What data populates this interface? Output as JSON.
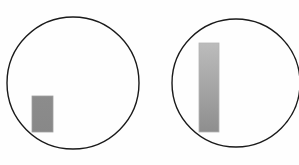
{
  "diagram": {
    "background": "#fefefe",
    "stroke_color": "#1a1a1a",
    "figures": [
      {
        "id": "left",
        "circle": {
          "cx": 73,
          "cy": 83,
          "r": 66
        },
        "bar": {
          "x": 32,
          "y": 96,
          "width": 21,
          "height": 36,
          "fill_top": "#8c8c8c",
          "fill_bottom": "#888888",
          "border": "#a0a0a0"
        }
      },
      {
        "id": "right",
        "circle": {
          "cx": 236,
          "cy": 83,
          "r": 64
        },
        "bar": {
          "x": 199,
          "y": 43,
          "width": 20,
          "height": 89,
          "fill_top": "#bcbcbc",
          "fill_bottom": "#8e8e8e",
          "border": "#b4b4b4"
        }
      }
    ]
  }
}
